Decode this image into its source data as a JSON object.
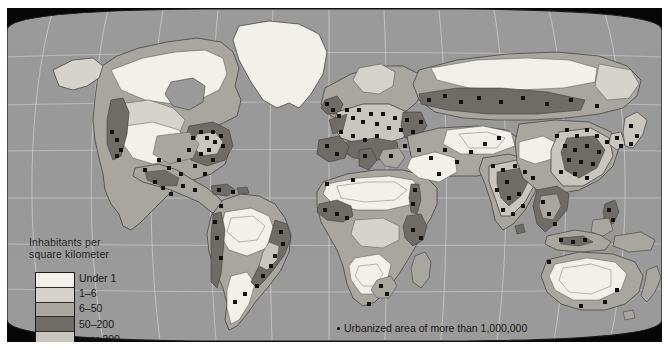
{
  "map": {
    "title": "World population density map",
    "projection": "pseudocylindrical-elliptical",
    "ocean_color": "#9a9a9a",
    "frame_color": "#070707",
    "graticule_color": "#d8d8d8"
  },
  "legend": {
    "title_line1": "Inhabitants per",
    "title_line2": "square kilometer",
    "classes": [
      {
        "label": "Under 1",
        "color": "#f2f0ea"
      },
      {
        "label": "1–6",
        "color": "#d5d3cc"
      },
      {
        "label": "6–50",
        "color": "#a9a6a0"
      },
      {
        "label": "50–200",
        "color": "#6f6c68"
      },
      {
        "label": "over 200",
        "color": "#c9c6c0"
      }
    ]
  },
  "urban_note": {
    "marker": "dot",
    "text": "Urbanized area of more than 1,000,000"
  },
  "regions": [
    {
      "name": "north-america",
      "note": "dense eastern seaboard, sparse interior west"
    },
    {
      "name": "south-america",
      "note": "dense Brazilian coast and Andes rim"
    },
    {
      "name": "europe",
      "note": "highest density class over 200 across central belt"
    },
    {
      "name": "africa",
      "note": "Nile valley, West Africa and Great Lakes dense"
    },
    {
      "name": "south-asia",
      "note": "India and Ganges plain over 200"
    },
    {
      "name": "east-asia",
      "note": "eastern China, Korea and Japan over 200"
    },
    {
      "name": "australia",
      "note": "interior under 1 inhabitant per square kilometer"
    }
  ]
}
